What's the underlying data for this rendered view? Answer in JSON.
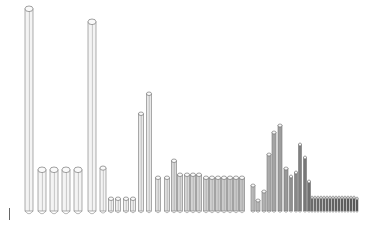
{
  "chart_data": {
    "type": "bar",
    "style": "3d-cylinder",
    "title": "",
    "xlabel": "",
    "ylabel": "",
    "grid": false,
    "legend": null,
    "ylim": [
      0,
      200
    ],
    "baseline_y": 211,
    "bars": [
      {
        "x": 29,
        "w": 8,
        "top": 6,
        "shade": "#f4f4f4"
      },
      {
        "x": 42,
        "w": 8,
        "top": 167,
        "shade": "#f4f4f4"
      },
      {
        "x": 54,
        "w": 8,
        "top": 167,
        "shade": "#f4f4f4"
      },
      {
        "x": 66,
        "w": 8,
        "top": 167,
        "shade": "#f4f4f4"
      },
      {
        "x": 78,
        "w": 8,
        "top": 167,
        "shade": "#f4f4f4"
      },
      {
        "x": 92,
        "w": 8,
        "top": 19,
        "shade": "#f4f4f4"
      },
      {
        "x": 103,
        "w": 6,
        "top": 166,
        "shade": "#f4f4f4"
      },
      {
        "x": 111,
        "w": 5,
        "top": 197,
        "shade": "#eeeeee"
      },
      {
        "x": 118,
        "w": 5,
        "top": 197,
        "shade": "#eeeeee"
      },
      {
        "x": 126,
        "w": 5,
        "top": 197,
        "shade": "#eeeeee"
      },
      {
        "x": 133,
        "w": 5,
        "top": 197,
        "shade": "#eeeeee"
      },
      {
        "x": 141,
        "w": 5,
        "top": 112,
        "shade": "#e8e8e8"
      },
      {
        "x": 149,
        "w": 5,
        "top": 92,
        "shade": "#e8e8e8"
      },
      {
        "x": 158,
        "w": 5,
        "top": 176,
        "shade": "#e0e0e0"
      },
      {
        "x": 167,
        "w": 5,
        "top": 176,
        "shade": "#e0e0e0"
      },
      {
        "x": 174,
        "w": 5,
        "top": 159,
        "shade": "#d8d8d8"
      },
      {
        "x": 180,
        "w": 5,
        "top": 173,
        "shade": "#d6d6d6"
      },
      {
        "x": 187,
        "w": 5,
        "top": 173,
        "shade": "#d6d6d6"
      },
      {
        "x": 193,
        "w": 5,
        "top": 173,
        "shade": "#d4d4d4"
      },
      {
        "x": 199,
        "w": 5,
        "top": 173,
        "shade": "#d4d4d4"
      },
      {
        "x": 206,
        "w": 5,
        "top": 176,
        "shade": "#d0d0d0"
      },
      {
        "x": 212,
        "w": 5,
        "top": 176,
        "shade": "#d0d0d0"
      },
      {
        "x": 218,
        "w": 5,
        "top": 176,
        "shade": "#cccccc"
      },
      {
        "x": 224,
        "w": 5,
        "top": 176,
        "shade": "#cccccc"
      },
      {
        "x": 230,
        "w": 5,
        "top": 176,
        "shade": "#c8c8c8"
      },
      {
        "x": 236,
        "w": 5,
        "top": 176,
        "shade": "#c8c8c8"
      },
      {
        "x": 242,
        "w": 5,
        "top": 176,
        "shade": "#c4c4c4"
      },
      {
        "x": 253,
        "w": 4,
        "top": 184,
        "shade": "#c0c0c0"
      },
      {
        "x": 258,
        "w": 4,
        "top": 199,
        "shade": "#bcbcbc"
      },
      {
        "x": 264,
        "w": 4,
        "top": 190,
        "shade": "#b8b8b8"
      },
      {
        "x": 269,
        "w": 4,
        "top": 153,
        "shade": "#b0b0b0"
      },
      {
        "x": 274,
        "w": 4,
        "top": 131,
        "shade": "#a8a8a8"
      },
      {
        "x": 280,
        "w": 4,
        "top": 124,
        "shade": "#a0a0a0"
      },
      {
        "x": 286,
        "w": 4,
        "top": 167,
        "shade": "#989898"
      },
      {
        "x": 291,
        "w": 3,
        "top": 175,
        "shade": "#909090"
      },
      {
        "x": 296,
        "w": 3,
        "top": 171,
        "shade": "#888888"
      },
      {
        "x": 300,
        "w": 3,
        "top": 143,
        "shade": "#808080"
      },
      {
        "x": 305,
        "w": 3,
        "top": 156,
        "shade": "#787878"
      },
      {
        "x": 309,
        "w": 3,
        "top": 180,
        "shade": "#707070"
      },
      {
        "x": 312,
        "w": 2,
        "top": 196,
        "shade": "#686868"
      },
      {
        "x": 315,
        "w": 2,
        "top": 196,
        "shade": "#686868"
      },
      {
        "x": 318,
        "w": 2,
        "top": 196,
        "shade": "#646464"
      },
      {
        "x": 321,
        "w": 2,
        "top": 196,
        "shade": "#646464"
      },
      {
        "x": 324,
        "w": 2,
        "top": 196,
        "shade": "#606060"
      },
      {
        "x": 327,
        "w": 2,
        "top": 196,
        "shade": "#606060"
      },
      {
        "x": 330,
        "w": 2,
        "top": 196,
        "shade": "#5c5c5c"
      },
      {
        "x": 333,
        "w": 2,
        "top": 196,
        "shade": "#5c5c5c"
      },
      {
        "x": 336,
        "w": 2,
        "top": 196,
        "shade": "#585858"
      },
      {
        "x": 339,
        "w": 2,
        "top": 196,
        "shade": "#585858"
      },
      {
        "x": 342,
        "w": 2,
        "top": 196,
        "shade": "#545454"
      },
      {
        "x": 345,
        "w": 2,
        "top": 196,
        "shade": "#545454"
      },
      {
        "x": 348,
        "w": 2,
        "top": 196,
        "shade": "#505050"
      },
      {
        "x": 351,
        "w": 2,
        "top": 196,
        "shade": "#505050"
      },
      {
        "x": 354,
        "w": 2,
        "top": 196,
        "shade": "#4c4c4c"
      },
      {
        "x": 357,
        "w": 2,
        "top": 197,
        "shade": "#4c4c4c"
      }
    ],
    "values": [
      205,
      44,
      44,
      44,
      44,
      192,
      45,
      14,
      14,
      14,
      14,
      99,
      119,
      35,
      35,
      52,
      38,
      38,
      38,
      38,
      35,
      35,
      35,
      35,
      35,
      35,
      35,
      27,
      12,
      21,
      58,
      80,
      87,
      44,
      36,
      40,
      68,
      55,
      31,
      15,
      15,
      15,
      15,
      15,
      15,
      15,
      15,
      15,
      15,
      15,
      15,
      15,
      15,
      15,
      14
    ]
  }
}
